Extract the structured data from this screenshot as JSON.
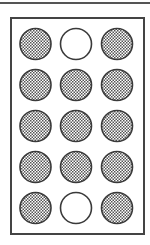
{
  "diagram": {
    "title": "",
    "grid": {
      "rows": 5,
      "cols": 3
    },
    "colors": {
      "stroke": "#3a3a3a",
      "frame": "#444444",
      "fill_dot": "#555555",
      "empty": "#ffffff"
    },
    "circles": [
      [
        "filled",
        "empty",
        "filled"
      ],
      [
        "filled",
        "filled",
        "filled"
      ],
      [
        "filled",
        "filled",
        "filled"
      ],
      [
        "filled",
        "filled",
        "filled"
      ],
      [
        "filled",
        "empty",
        "filled"
      ]
    ],
    "counts": {
      "filled": 13,
      "empty": 2
    }
  }
}
